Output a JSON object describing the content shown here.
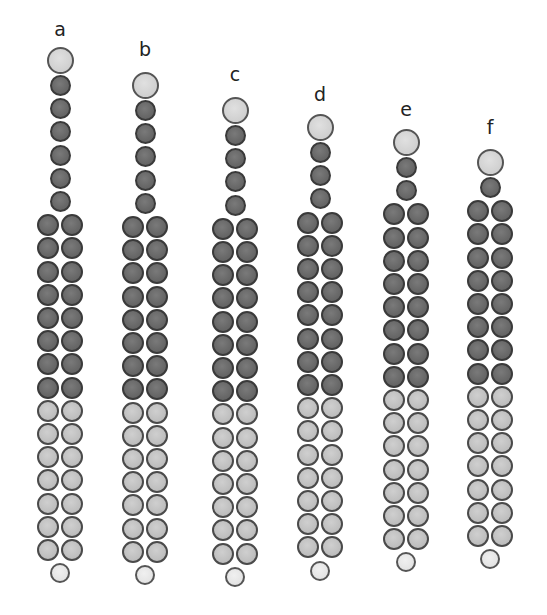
{
  "diagram": {
    "colors": {
      "dark_bead": "#676767",
      "light_bead": "#bdbdbd",
      "top_bead": "#cdcdcd",
      "bottom_bead": "#e2e2e2",
      "outline": "#3a3a3a",
      "label": "#222222"
    },
    "columns": [
      {
        "label": "a",
        "cx": 60,
        "label_y": 18,
        "top_y": 60,
        "dark_singles": 6,
        "dark_pairs": 8,
        "light_pairs": 7,
        "bottom_single": 1
      },
      {
        "label": "b",
        "cx": 145,
        "label_y": 38,
        "top_y": 85,
        "dark_singles": 5,
        "dark_pairs": 8,
        "light_pairs": 7,
        "bottom_single": 1
      },
      {
        "label": "c",
        "cx": 235,
        "label_y": 63,
        "top_y": 110,
        "dark_singles": 4,
        "dark_pairs": 8,
        "light_pairs": 7,
        "bottom_single": 1
      },
      {
        "label": "d",
        "cx": 320,
        "label_y": 83,
        "top_y": 127,
        "dark_singles": 3,
        "dark_pairs": 8,
        "light_pairs": 7,
        "bottom_single": 1
      },
      {
        "label": "e",
        "cx": 406,
        "label_y": 98,
        "top_y": 142,
        "dark_singles": 2,
        "dark_pairs": 8,
        "light_pairs": 7,
        "bottom_single": 1
      },
      {
        "label": "f",
        "cx": 490,
        "label_y": 116,
        "top_y": 162,
        "dark_singles": 1,
        "dark_pairs": 8,
        "light_pairs": 7,
        "bottom_single": 1
      }
    ]
  }
}
